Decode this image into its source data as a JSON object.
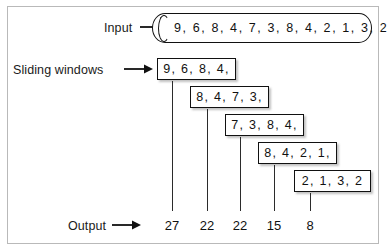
{
  "figure": {
    "colors": {
      "frame_border": "#b9b9b9",
      "stroke": "#111111",
      "text": "#1a1a1a",
      "background": "#ffffff"
    }
  },
  "labels": {
    "input": "Input",
    "sliding_windows": "Sliding windows",
    "output": "Output"
  },
  "input_stream": {
    "values": [
      9,
      6,
      8,
      4,
      7,
      3,
      8,
      4,
      2,
      1,
      3,
      2
    ],
    "text": "9, 6, 8, 4, 7, 3, 8, 4, 2, 1, 3, 2"
  },
  "windows": [
    {
      "text": "9, 6, 8, 4,",
      "values": [
        9,
        6,
        8,
        4
      ],
      "sum": 27
    },
    {
      "text": "8, 4, 7, 3,",
      "values": [
        8,
        4,
        7,
        3
      ],
      "sum": 22
    },
    {
      "text": "7, 3, 8, 4,",
      "values": [
        7,
        3,
        8,
        4
      ],
      "sum": 22
    },
    {
      "text": "8, 4, 2, 1,",
      "values": [
        8,
        4,
        2,
        1
      ],
      "sum": 15
    },
    {
      "text": "2, 1, 3, 2",
      "values": [
        2,
        1,
        3,
        2
      ],
      "sum": 8
    }
  ],
  "output": {
    "values": [
      "27",
      "22",
      "22",
      "15",
      "8"
    ]
  },
  "icons": {
    "arrow_input": "right-arrow-icon",
    "arrow_windows": "right-arrow-icon",
    "arrow_output": "right-arrow-icon"
  }
}
